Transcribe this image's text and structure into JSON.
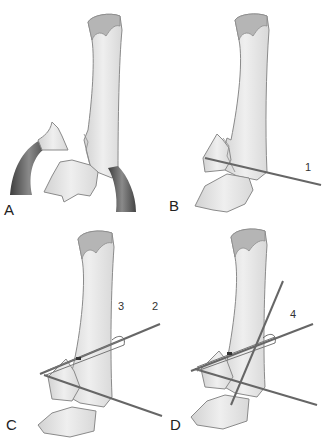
{
  "figure": {
    "type": "surgical-illustration",
    "panels": [
      {
        "id": "A",
        "label": "A",
        "pins": []
      },
      {
        "id": "B",
        "label": "B",
        "pins": [
          {
            "label": "1"
          }
        ]
      },
      {
        "id": "C",
        "label": "C",
        "pins": [
          {
            "label": "2"
          },
          {
            "label": "3"
          }
        ]
      },
      {
        "id": "D",
        "label": "D",
        "pins": [
          {
            "label": "4"
          }
        ]
      }
    ],
    "colors": {
      "bone_fill": "#e4e4e4",
      "bone_outline": "#8a8a8a",
      "bone_head": "#b8b8b8",
      "tendon": "#5a5a5a",
      "pin": "#6a6a6a",
      "background": "#ffffff"
    }
  }
}
